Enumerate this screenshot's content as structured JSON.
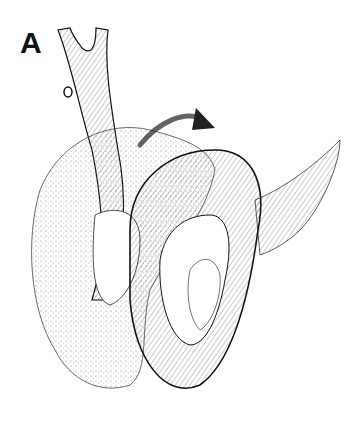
{
  "figure": {
    "panel_label": "A",
    "colors": {
      "ink": "#111111",
      "background": "#ffffff",
      "stipple": "#555555"
    }
  }
}
